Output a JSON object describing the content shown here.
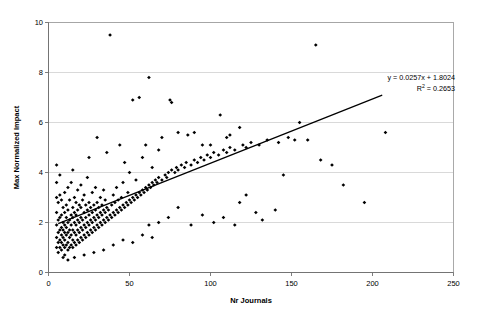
{
  "chart_data": {
    "type": "scatter",
    "title": "",
    "xlabel": "Nr Journals",
    "ylabel": "Max Normalized Impact",
    "xlim": [
      0,
      250
    ],
    "ylim": [
      0,
      10
    ],
    "xticks": [
      "0",
      "50",
      "100",
      "150",
      "200",
      "250"
    ],
    "yticks": [
      "0",
      "2",
      "4",
      "6",
      "8",
      "10"
    ],
    "xtick_values": [
      0,
      50,
      100,
      150,
      200,
      250
    ],
    "ytick_values": [
      0,
      2,
      4,
      6,
      8,
      10
    ],
    "grid": "horizontal",
    "legend": "none",
    "marker_color": "#000000",
    "trendline_color": "#000000",
    "gridline_color": "#c8c8c8",
    "annotations": {
      "equation": "y = 0.0257x + 1.8024",
      "r_squared_label": "R",
      "r_squared_exponent": "2",
      "r_squared_value": "= 0.2653"
    },
    "trendline": {
      "slope": 0.0257,
      "intercept": 1.8024,
      "r_squared": 0.2653,
      "x_start": 6,
      "x_end": 206
    },
    "points": [
      [
        5,
        1.0
      ],
      [
        5,
        1.4
      ],
      [
        5,
        1.9
      ],
      [
        5,
        2.4
      ],
      [
        5,
        3.0
      ],
      [
        5,
        3.6
      ],
      [
        5,
        4.3
      ],
      [
        6,
        0.8
      ],
      [
        6,
        1.2
      ],
      [
        6,
        1.6
      ],
      [
        6,
        2.1
      ],
      [
        6,
        2.8
      ],
      [
        7,
        1.0
      ],
      [
        7,
        1.3
      ],
      [
        7,
        1.7
      ],
      [
        7,
        2.2
      ],
      [
        7,
        3.1
      ],
      [
        7,
        3.9
      ],
      [
        8,
        0.9
      ],
      [
        8,
        1.2
      ],
      [
        8,
        1.5
      ],
      [
        8,
        1.8
      ],
      [
        8,
        2.3
      ],
      [
        8,
        2.9
      ],
      [
        9,
        0.6
      ],
      [
        9,
        1.1
      ],
      [
        9,
        1.4
      ],
      [
        9,
        1.7
      ],
      [
        9,
        2.0
      ],
      [
        9,
        2.6
      ],
      [
        10,
        0.7
      ],
      [
        10,
        1.0
      ],
      [
        10,
        1.3
      ],
      [
        10,
        1.6
      ],
      [
        10,
        1.9
      ],
      [
        10,
        2.4
      ],
      [
        10,
        3.2
      ],
      [
        11,
        1.1
      ],
      [
        11,
        1.5
      ],
      [
        11,
        1.8
      ],
      [
        11,
        2.2
      ],
      [
        11,
        2.7
      ],
      [
        12,
        0.9
      ],
      [
        12,
        1.2
      ],
      [
        12,
        1.6
      ],
      [
        12,
        2.0
      ],
      [
        12,
        2.5
      ],
      [
        12,
        3.4
      ],
      [
        13,
        1.0
      ],
      [
        13,
        1.4
      ],
      [
        13,
        1.7
      ],
      [
        13,
        2.1
      ],
      [
        13,
        2.9
      ],
      [
        14,
        1.1
      ],
      [
        14,
        1.5
      ],
      [
        14,
        1.9
      ],
      [
        14,
        2.3
      ],
      [
        14,
        3.6
      ],
      [
        15,
        1.0
      ],
      [
        15,
        1.3
      ],
      [
        15,
        1.7
      ],
      [
        15,
        2.2
      ],
      [
        15,
        2.6
      ],
      [
        15,
        4.1
      ],
      [
        16,
        1.2
      ],
      [
        16,
        1.6
      ],
      [
        16,
        2.0
      ],
      [
        16,
        2.4
      ],
      [
        16,
        3.0
      ],
      [
        17,
        1.1
      ],
      [
        17,
        1.5
      ],
      [
        17,
        1.9
      ],
      [
        17,
        2.3
      ],
      [
        17,
        2.8
      ],
      [
        18,
        1.3
      ],
      [
        18,
        1.7
      ],
      [
        18,
        2.1
      ],
      [
        18,
        2.5
      ],
      [
        18,
        3.3
      ],
      [
        19,
        1.2
      ],
      [
        19,
        1.6
      ],
      [
        19,
        2.0
      ],
      [
        19,
        2.7
      ],
      [
        20,
        1.4
      ],
      [
        20,
        1.8
      ],
      [
        20,
        2.2
      ],
      [
        20,
        2.6
      ],
      [
        20,
        3.5
      ],
      [
        21,
        1.3
      ],
      [
        21,
        1.7
      ],
      [
        21,
        2.1
      ],
      [
        21,
        2.9
      ],
      [
        22,
        1.5
      ],
      [
        22,
        1.9
      ],
      [
        22,
        2.4
      ],
      [
        22,
        3.1
      ],
      [
        23,
        1.4
      ],
      [
        23,
        1.8
      ],
      [
        23,
        2.2
      ],
      [
        23,
        2.7
      ],
      [
        24,
        1.6
      ],
      [
        24,
        2.0
      ],
      [
        24,
        2.5
      ],
      [
        24,
        3.8
      ],
      [
        25,
        1.5
      ],
      [
        25,
        1.9
      ],
      [
        25,
        2.3
      ],
      [
        25,
        2.8
      ],
      [
        25,
        4.6
      ],
      [
        26,
        1.7
      ],
      [
        26,
        2.1
      ],
      [
        26,
        2.6
      ],
      [
        27,
        1.6
      ],
      [
        27,
        2.0
      ],
      [
        27,
        2.4
      ],
      [
        27,
        3.2
      ],
      [
        28,
        1.8
      ],
      [
        28,
        2.2
      ],
      [
        28,
        2.7
      ],
      [
        29,
        1.7
      ],
      [
        29,
        2.1
      ],
      [
        29,
        2.5
      ],
      [
        29,
        3.4
      ],
      [
        30,
        1.9
      ],
      [
        30,
        2.3
      ],
      [
        30,
        2.8
      ],
      [
        30,
        5.4
      ],
      [
        31,
        1.8
      ],
      [
        31,
        2.2
      ],
      [
        31,
        2.6
      ],
      [
        32,
        2.0
      ],
      [
        32,
        2.4
      ],
      [
        32,
        3.0
      ],
      [
        33,
        1.9
      ],
      [
        33,
        2.3
      ],
      [
        33,
        2.7
      ],
      [
        34,
        2.1
      ],
      [
        34,
        2.5
      ],
      [
        34,
        3.3
      ],
      [
        35,
        2.0
      ],
      [
        35,
        2.4
      ],
      [
        35,
        2.9
      ],
      [
        36,
        2.2
      ],
      [
        36,
        2.6
      ],
      [
        36,
        4.8
      ],
      [
        37,
        2.1
      ],
      [
        37,
        2.5
      ],
      [
        38,
        2.3
      ],
      [
        38,
        9.5
      ],
      [
        39,
        2.2
      ],
      [
        39,
        2.7
      ],
      [
        40,
        2.4
      ],
      [
        40,
        3.1
      ],
      [
        41,
        2.3
      ],
      [
        41,
        2.8
      ],
      [
        42,
        2.5
      ],
      [
        42,
        3.4
      ],
      [
        43,
        2.4
      ],
      [
        43,
        2.9
      ],
      [
        44,
        2.6
      ],
      [
        44,
        5.1
      ],
      [
        45,
        2.5
      ],
      [
        45,
        3.0
      ],
      [
        46,
        2.7
      ],
      [
        46,
        3.6
      ],
      [
        47,
        2.6
      ],
      [
        47,
        4.4
      ],
      [
        48,
        2.8
      ],
      [
        49,
        2.7
      ],
      [
        49,
        3.2
      ],
      [
        50,
        2.9
      ],
      [
        50,
        4.0
      ],
      [
        51,
        2.8
      ],
      [
        52,
        3.0
      ],
      [
        52,
        6.9
      ],
      [
        53,
        2.9
      ],
      [
        54,
        3.1
      ],
      [
        54,
        3.7
      ],
      [
        55,
        3.0
      ],
      [
        56,
        3.2
      ],
      [
        56,
        7.0
      ],
      [
        57,
        3.1
      ],
      [
        58,
        3.3
      ],
      [
        58,
        4.6
      ],
      [
        59,
        3.2
      ],
      [
        60,
        3.4
      ],
      [
        60,
        5.1
      ],
      [
        61,
        3.3
      ],
      [
        62,
        3.5
      ],
      [
        62,
        7.8
      ],
      [
        63,
        3.4
      ],
      [
        64,
        3.6
      ],
      [
        64,
        4.2
      ],
      [
        65,
        3.5
      ],
      [
        66,
        3.7
      ],
      [
        67,
        3.6
      ],
      [
        68,
        3.8
      ],
      [
        68,
        4.9
      ],
      [
        70,
        3.7
      ],
      [
        70,
        5.4
      ],
      [
        72,
        3.9
      ],
      [
        73,
        3.8
      ],
      [
        74,
        4.0
      ],
      [
        75,
        6.9
      ],
      [
        76,
        4.1
      ],
      [
        76,
        6.8
      ],
      [
        78,
        4.0
      ],
      [
        79,
        4.2
      ],
      [
        80,
        4.1
      ],
      [
        80,
        5.6
      ],
      [
        82,
        4.3
      ],
      [
        84,
        4.2
      ],
      [
        85,
        4.4
      ],
      [
        86,
        5.5
      ],
      [
        88,
        4.3
      ],
      [
        90,
        4.5
      ],
      [
        90,
        5.6
      ],
      [
        92,
        4.4
      ],
      [
        94,
        4.6
      ],
      [
        95,
        5.1
      ],
      [
        96,
        4.5
      ],
      [
        98,
        4.7
      ],
      [
        100,
        4.6
      ],
      [
        100,
        5.1
      ],
      [
        102,
        4.8
      ],
      [
        105,
        4.7
      ],
      [
        106,
        6.3
      ],
      [
        108,
        4.9
      ],
      [
        110,
        4.8
      ],
      [
        110,
        5.4
      ],
      [
        112,
        5.0
      ],
      [
        112,
        5.5
      ],
      [
        115,
        4.9
      ],
      [
        118,
        5.8
      ],
      [
        120,
        5.1
      ],
      [
        122,
        5.0
      ],
      [
        125,
        5.2
      ],
      [
        128,
        2.4
      ],
      [
        130,
        5.1
      ],
      [
        132,
        2.1
      ],
      [
        135,
        5.3
      ],
      [
        140,
        2.5
      ],
      [
        142,
        5.2
      ],
      [
        145,
        3.9
      ],
      [
        148,
        5.4
      ],
      [
        152,
        5.3
      ],
      [
        155,
        6.0
      ],
      [
        160,
        5.3
      ],
      [
        165,
        9.1
      ],
      [
        168,
        4.5
      ],
      [
        175,
        4.3
      ],
      [
        182,
        3.5
      ],
      [
        195,
        2.8
      ],
      [
        208,
        5.6
      ],
      [
        62,
        1.9
      ],
      [
        68,
        2.0
      ],
      [
        74,
        2.2
      ],
      [
        80,
        2.6
      ],
      [
        88,
        1.9
      ],
      [
        95,
        2.3
      ],
      [
        102,
        2.0
      ],
      [
        108,
        2.2
      ],
      [
        115,
        1.9
      ],
      [
        118,
        2.8
      ],
      [
        122,
        3.1
      ],
      [
        34,
        0.9
      ],
      [
        40,
        1.1
      ],
      [
        46,
        1.3
      ],
      [
        52,
        1.2
      ],
      [
        58,
        1.5
      ],
      [
        64,
        1.4
      ],
      [
        28,
        0.8
      ],
      [
        22,
        0.7
      ],
      [
        16,
        0.6
      ],
      [
        12,
        0.5
      ]
    ]
  }
}
